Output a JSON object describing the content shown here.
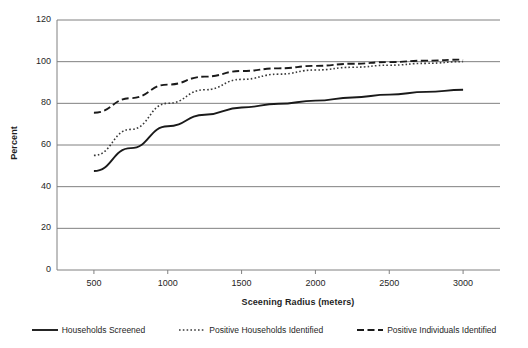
{
  "chart_data": {
    "type": "line",
    "title": "",
    "xlabel": "Sceening Radius (meters)",
    "ylabel": "Percent",
    "x": [
      500,
      750,
      1000,
      1250,
      1500,
      1750,
      2000,
      2250,
      2500,
      2750,
      3000
    ],
    "xlim": [
      250,
      3250
    ],
    "ylim": [
      0,
      120
    ],
    "xticks": [
      500,
      1000,
      1500,
      2000,
      2500,
      3000
    ],
    "yticks": [
      0,
      20,
      40,
      60,
      80,
      100,
      120
    ],
    "grid": "horizontal",
    "legend_position": "bottom",
    "series": [
      {
        "name": "Households Screened",
        "style": "solid",
        "color": "#1a1a1a",
        "values": [
          47.5,
          58.5,
          69.0,
          74.5,
          78.0,
          79.8,
          81.3,
          82.8,
          84.2,
          85.5,
          86.5
        ]
      },
      {
        "name": "Positive Households Identified",
        "style": "dotted",
        "color": "#3a3a3a",
        "values": [
          55.0,
          67.5,
          80.0,
          86.5,
          91.5,
          94.0,
          96.0,
          97.3,
          98.3,
          99.2,
          100.0
        ]
      },
      {
        "name": "Positive Individuals Identified",
        "style": "dashed",
        "color": "#1a1a1a",
        "values": [
          75.5,
          82.5,
          89.0,
          92.8,
          95.5,
          96.8,
          98.0,
          99.0,
          99.8,
          100.5,
          101.0
        ]
      }
    ]
  },
  "axes": {
    "y_tick_labels": [
      "0",
      "20",
      "40",
      "60",
      "80",
      "100",
      "120"
    ],
    "x_tick_labels": [
      "500",
      "1000",
      "1500",
      "2000",
      "2500",
      "3000"
    ],
    "y_title": "Percent",
    "x_title": "Sceening Radius (meters)"
  },
  "legend": {
    "items": [
      {
        "label": "Households Screened",
        "swatch": "solid-line-swatch"
      },
      {
        "label": "Positive Households Identified",
        "swatch": "dotted-line-swatch"
      },
      {
        "label": "Positive Individuals Identified",
        "swatch": "dashed-line-swatch"
      }
    ]
  },
  "style": {
    "grid_color": "#808080",
    "axis_color": "#808080",
    "plot_background": "#ffffff"
  }
}
